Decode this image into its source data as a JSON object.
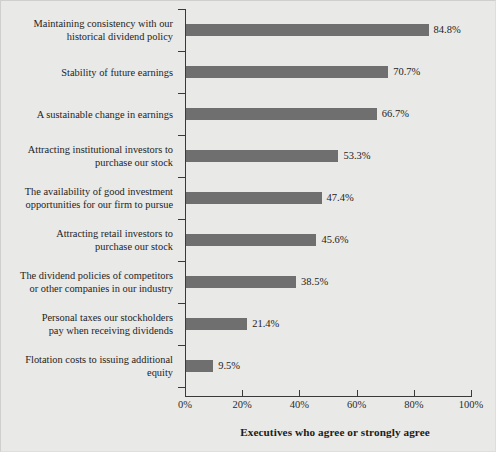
{
  "chart_data": {
    "type": "bar",
    "orientation": "horizontal",
    "title": "",
    "xlabel": "Executives who agree or strongly agree",
    "ylabel": "",
    "xlim": [
      0,
      100
    ],
    "grid": false,
    "legend": null,
    "xtick_labels": [
      "0%",
      "20%",
      "40%",
      "60%",
      "80%",
      "100%"
    ],
    "xticks": [
      0,
      20,
      40,
      60,
      80,
      100
    ],
    "categories": [
      "Maintaining consistency with our historical dividend policy",
      "Stability of future earnings",
      "A sustainable change in earnings",
      "Attracting institutional investors to purchase our stock",
      "The availability of good investment opportunities for our firm to pursue",
      "Attracting retail investors to purchase our stock",
      "The dividend policies of competitors or other companies in our industry",
      "Personal taxes our stockholders pay when receiving dividends",
      "Flotation costs to issuing additional equity"
    ],
    "category_lines": [
      [
        "Maintaining consistency with our",
        "historical dividend policy"
      ],
      [
        "Stability of future earnings"
      ],
      [
        "A sustainable change in earnings"
      ],
      [
        "Attracting institutional investors to",
        "purchase our stock"
      ],
      [
        "The availability of good investment",
        "opportunities for our firm to pursue"
      ],
      [
        "Attracting retail investors to",
        "purchase our stock"
      ],
      [
        "The dividend policies of competitors",
        "or other companies in our industry"
      ],
      [
        "Personal taxes our stockholders",
        "pay when receiving dividends"
      ],
      [
        "Flotation costs to issuing additional",
        "equity"
      ]
    ],
    "values": [
      84.8,
      70.7,
      66.7,
      53.3,
      47.4,
      45.6,
      38.5,
      21.4,
      9.5
    ],
    "value_labels": [
      "84.8%",
      "70.7%",
      "66.7%",
      "53.3%",
      "47.4%",
      "45.6%",
      "38.5%",
      "21.4%",
      "9.5%"
    ],
    "bar_color": "#706f6f",
    "background_color": "#e9e9e7",
    "axis_color": "#3a3a3a",
    "text_color": "#242424"
  }
}
